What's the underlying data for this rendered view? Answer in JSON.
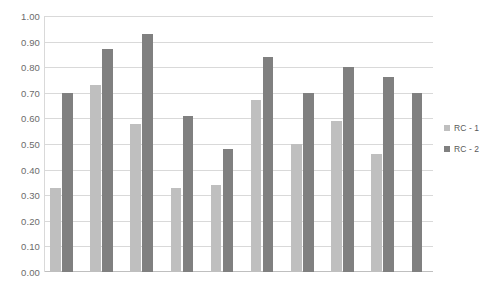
{
  "chart_data": {
    "type": "bar",
    "title": "",
    "subtitle": "",
    "xlabel": "",
    "ylabel": "",
    "ylim": [
      0.0,
      1.0
    ],
    "ytick_step": 0.1,
    "ytick_labels": [
      "1.00",
      "0.90",
      "0.80",
      "0.70",
      "0.60",
      "0.50",
      "0.40",
      "0.30",
      "0.20",
      "0.10",
      "0.00"
    ],
    "ytick_values": [
      1.0,
      0.9,
      0.8,
      0.7,
      0.6,
      0.5,
      0.4,
      0.3,
      0.2,
      0.1,
      0.0
    ],
    "grid": true,
    "grid_axis": "y",
    "legend_position": "right",
    "categories": [
      "1",
      "2",
      "3",
      "4",
      "5",
      "6",
      "7",
      "8",
      "9"
    ],
    "series": [
      {
        "name": "RC - 1",
        "color": "#BFBFBF",
        "values": [
          0.33,
          0.73,
          0.58,
          0.33,
          0.34,
          0.67,
          0.5,
          0.59,
          0.46
        ]
      },
      {
        "name": "RC - 2",
        "color": "#808080",
        "values": [
          0.7,
          0.87,
          0.93,
          0.61,
          0.48,
          0.84,
          0.7,
          0.8,
          0.76
        ]
      }
    ],
    "extra_trailing_bar": {
      "series": "RC - 2",
      "value": 0.7,
      "color": "#808080"
    }
  },
  "legend": {
    "items": [
      {
        "label": "RC - 1",
        "color": "#BFBFBF"
      },
      {
        "label": "RC - 2",
        "color": "#808080"
      }
    ]
  },
  "colors": {
    "series_1": "#BFBFBF",
    "series_2": "#808080",
    "gridline": "#D9D9D9",
    "axis": "#BFBFBF",
    "tick_text": "#6B6B6B",
    "legend_text": "#595959",
    "background": "#FFFFFF"
  }
}
